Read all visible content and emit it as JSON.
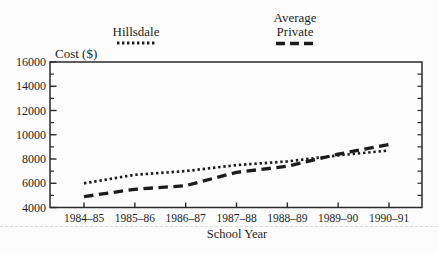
{
  "figure": {
    "ylabel": "Cost ($)",
    "xlabel": "School Year"
  },
  "legend": {
    "items": [
      {
        "label": "Hillsdale",
        "style": "dotted"
      },
      {
        "label": "Average\nPrivate",
        "style": "dashed"
      }
    ]
  },
  "chart_data": {
    "type": "line",
    "title": "",
    "xlabel": "School Year",
    "ylabel": "Cost ($)",
    "ylim": [
      4000,
      16000
    ],
    "ytick_major_step": 2000,
    "ytick_minor_step": 1000,
    "ytick_labels": [
      "4000",
      "6000",
      "8000",
      "10000",
      "12000",
      "14000",
      "16000"
    ],
    "grid": false,
    "legend_position": "top",
    "categories": [
      "1984–85",
      "1985–86",
      "1986–87",
      "1987–88",
      "1988–89",
      "1989–90",
      "1990–91"
    ],
    "series": [
      {
        "name": "Hillsdale",
        "line_style": "dotted",
        "color": "#1c1c1c",
        "values": [
          6000,
          6700,
          7000,
          7500,
          7800,
          8300,
          8700
        ]
      },
      {
        "name": "Average Private",
        "line_style": "dashed",
        "color": "#1c1c1c",
        "values": [
          4900,
          5500,
          5800,
          6900,
          7400,
          8400,
          9200
        ]
      }
    ]
  },
  "colors": {
    "ink": "#1f1f1f",
    "axis": "#2a2a2a",
    "background": "#fcfcfc",
    "artifact_gray": "#dcdcdc"
  }
}
